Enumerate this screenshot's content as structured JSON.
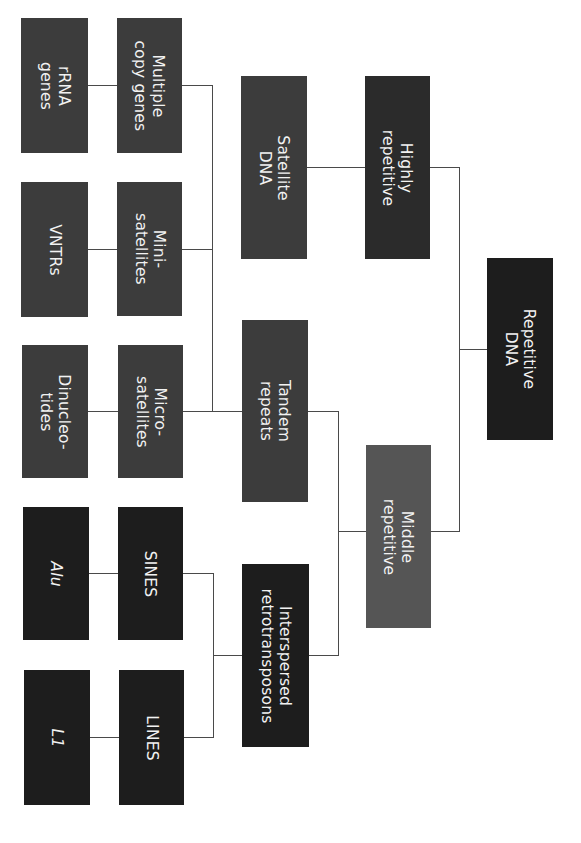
{
  "diagram": {
    "orientation": "rotated 90 degrees clockwise",
    "root": {
      "id": "repetitive_dna",
      "label": "Repetitive\nDNA"
    },
    "level1": [
      {
        "id": "highly_repetitive",
        "label": "Highly\nrepetitive",
        "parent": "repetitive_dna"
      },
      {
        "id": "middle_repetitive",
        "label": "Middle\nrepetitive",
        "parent": "repetitive_dna"
      }
    ],
    "level2": [
      {
        "id": "satellite_dna",
        "label": "Satellite\nDNA",
        "parent": "highly_repetitive"
      },
      {
        "id": "tandem_repeats",
        "label": "Tandem\nrepeats",
        "parent": "middle_repetitive"
      },
      {
        "id": "interspersed_retrotransposons",
        "label": "Interspersed\nretrotransposons",
        "parent": "middle_repetitive"
      }
    ],
    "level3": [
      {
        "id": "multiple_copy_genes",
        "label": "Multiple\ncopy genes",
        "parent": "tandem_repeats"
      },
      {
        "id": "minisatellites",
        "label": "Mini-\nsatellites",
        "parent": "tandem_repeats"
      },
      {
        "id": "microsatellites",
        "label": "Micro-\nsatellites",
        "parent": "tandem_repeats"
      },
      {
        "id": "sines",
        "label": "SINES",
        "parent": "interspersed_retrotransposons"
      },
      {
        "id": "lines",
        "label": "LINES",
        "parent": "interspersed_retrotransposons"
      }
    ],
    "level4": [
      {
        "id": "rrna_genes",
        "label": "rRNA\ngenes",
        "parent": "multiple_copy_genes"
      },
      {
        "id": "vntrs",
        "label": "VNTRs",
        "parent": "minisatellites"
      },
      {
        "id": "dinucleotides",
        "label": "Dinucleo-\ntides",
        "parent": "microsatellites"
      },
      {
        "id": "alu",
        "label": "Alu",
        "parent": "sines"
      },
      {
        "id": "l1",
        "label": "L1",
        "parent": "lines"
      }
    ]
  }
}
